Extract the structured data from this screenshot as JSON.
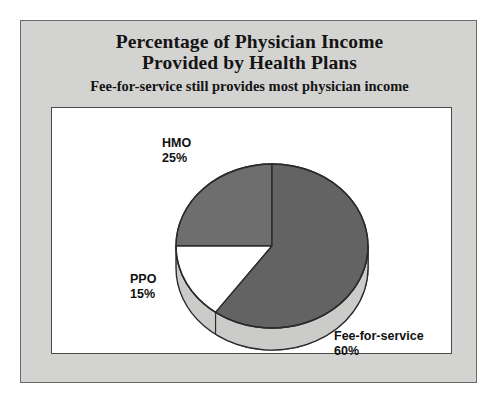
{
  "figure": {
    "title_line_1": "Percentage of Physician Income",
    "title_line_2": "Provided by Health Plans",
    "subtitle": "Fee-for-service still provides most physician income"
  },
  "labels": {
    "hmo_name": "HMO",
    "hmo_pct": "25%",
    "ppo_name": "PPO",
    "ppo_pct": "15%",
    "ffs_name": "Fee-for-service",
    "ffs_pct": "60%"
  },
  "colors": {
    "page_background": "#ffffff",
    "panel_background": "#d3d3d1",
    "panel_border": "#6a6a68",
    "plot_background": "#ffffff",
    "plot_border": "#4a4a48",
    "slice_gray": "#6e6e6e",
    "slice_gray_dark": "#636363",
    "slice_white": "#ffffff",
    "pie_depth_light": "#cbcbc9",
    "pie_outline": "#2b2b2b",
    "text": "#141414"
  },
  "chart_data": {
    "type": "pie",
    "title": "Percentage of Physician Income Provided by Health Plans",
    "subtitle": "Fee-for-service still provides most physician income",
    "xlabel": "",
    "ylabel": "",
    "units": "percent",
    "total": 100,
    "grid": false,
    "legend": false,
    "label_position": "outside",
    "three_d": true,
    "start_angle_deg": 90,
    "direction": "counterclockwise",
    "categories": [
      "HMO",
      "PPO",
      "Fee-for-service"
    ],
    "values": [
      25,
      15,
      60
    ],
    "slices": [
      {
        "name": "HMO",
        "value": 25,
        "label": "25%",
        "fill": "#6e6e6e",
        "start_deg": 90,
        "end_deg": 180
      },
      {
        "name": "PPO",
        "value": 15,
        "label": "15%",
        "fill": "#ffffff",
        "start_deg": 180,
        "end_deg": 234
      },
      {
        "name": "Fee-for-service",
        "value": 60,
        "label": "60%",
        "fill": "#636363",
        "start_deg": 234,
        "end_deg": 450
      }
    ]
  }
}
